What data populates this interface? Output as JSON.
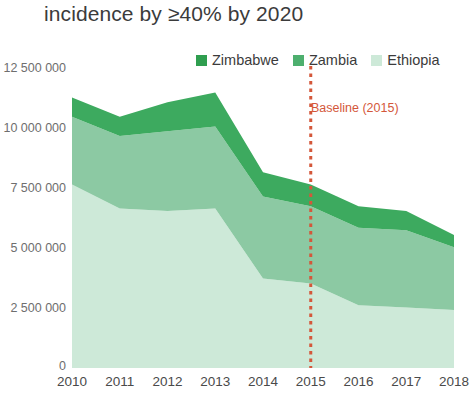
{
  "title": "incidence by ≥40% by 2020",
  "legend": {
    "position": "top",
    "items": [
      {
        "label": "Zimbabwe",
        "color": "#2f9e4f",
        "swatch_name": "legend-swatch-zimbabwe"
      },
      {
        "label": "Zambia",
        "color": "#4daf6e",
        "swatch_name": "legend-swatch-zambia"
      },
      {
        "label": "Ethiopia",
        "color": "#cde9d8",
        "swatch_name": "legend-swatch-ethiopia"
      }
    ]
  },
  "annotation": {
    "text": "Baseline (2015)",
    "color": "#d4573a",
    "at_x": "2015",
    "line_style": "dotted"
  },
  "axis": {
    "y_ticks": [
      "0",
      "2 500 000",
      "5 000 000",
      "7 500 000",
      "10 000 000",
      "12 500 000"
    ],
    "x_ticks": [
      "2010",
      "2011",
      "2012",
      "2013",
      "2014",
      "2015",
      "2016",
      "2017",
      "2018"
    ]
  },
  "chart_data": {
    "type": "area",
    "stacked": true,
    "title": "incidence by ≥40% by 2020",
    "xlabel": "",
    "ylabel": "",
    "x": [
      2010,
      2011,
      2012,
      2013,
      2014,
      2015,
      2016,
      2017,
      2018
    ],
    "categories": [
      "2010",
      "2011",
      "2012",
      "2013",
      "2014",
      "2015",
      "2016",
      "2017",
      "2018"
    ],
    "ylim": [
      0,
      12500000
    ],
    "xlim": [
      2010,
      2018
    ],
    "y_tick_values": [
      0,
      2500000,
      5000000,
      7500000,
      10000000,
      12500000
    ],
    "grid": false,
    "legend_position": "top",
    "series": [
      {
        "name": "Ethiopia",
        "color": "#cde9d8",
        "stack_order": 1,
        "values": [
          7600000,
          6600000,
          6500000,
          6600000,
          3700000,
          3500000,
          2600000,
          2500000,
          2400000
        ]
      },
      {
        "name": "Zambia",
        "color": "#8cc9a3",
        "stack_order": 2,
        "values": [
          2800000,
          3000000,
          3300000,
          3400000,
          3400000,
          3200000,
          3200000,
          3200000,
          2600000
        ]
      },
      {
        "name": "Zimbabwe",
        "color": "#3daa5f",
        "stack_order": 3,
        "values": [
          800000,
          800000,
          1200000,
          1400000,
          1000000,
          900000,
          900000,
          800000,
          500000
        ]
      }
    ],
    "cumulative_totals": [
      11200000,
      10400000,
      11000000,
      11400000,
      8100000,
      7600000,
      6700000,
      6500000,
      5500000
    ],
    "annotations": [
      {
        "text": "Baseline (2015)",
        "x": 2015,
        "color": "#d4573a",
        "type": "vertical-dotted-line"
      }
    ]
  }
}
